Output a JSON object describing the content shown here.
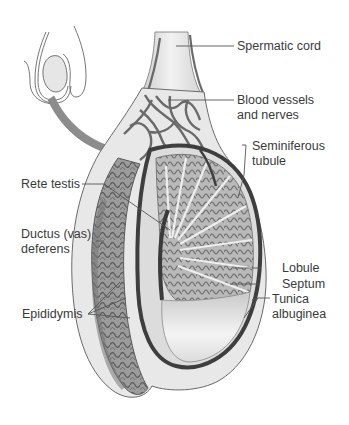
{
  "figure": {
    "labels": {
      "spermatic_cord": "Spermatic cord",
      "blood_vessels_1": "Blood vessels",
      "blood_vessels_2": "and nerves",
      "seminiferous_1": "Seminiferous",
      "seminiferous_2": "tubule",
      "rete_testis": "Rete testis",
      "ductus_1": "Ductus (vas)",
      "ductus_2": "deferens",
      "lobule": "Lobule",
      "septum": "Septum",
      "tunica_1": "Tunica",
      "tunica_2": "albuginea",
      "epididymis": "Epididymis"
    },
    "colors": {
      "outline": "#555555",
      "tissue_dark": "#8a8a8a",
      "tissue_mid": "#a9a9a9",
      "tissue_light": "#d6d6d6",
      "arrow": "#8c8c8c",
      "leader": "#555555",
      "text": "#3a3a3a"
    }
  }
}
